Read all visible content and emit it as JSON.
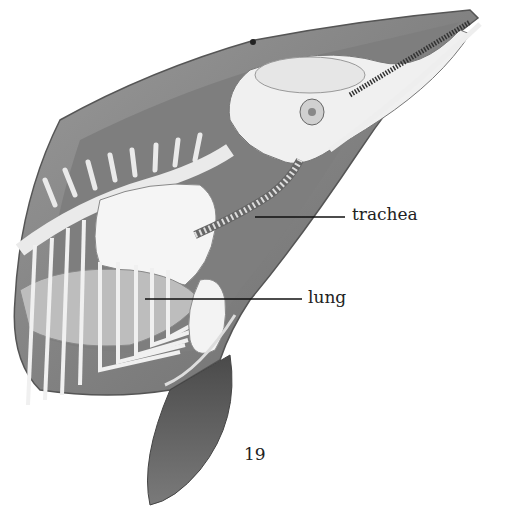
{
  "illustration": {
    "subject": "dolphin head and thorax anatomy cross-section",
    "labels": [
      {
        "id": "trachea",
        "text": "trachea"
      },
      {
        "id": "lung",
        "text": "lung"
      }
    ]
  },
  "page": {
    "number": "19"
  },
  "colors": {
    "background": "#ffffff",
    "skin_dark": "#5a5a5a",
    "skin_mid": "#8c8c8c",
    "bone": "#f2f2f2",
    "label_text": "#222222"
  }
}
